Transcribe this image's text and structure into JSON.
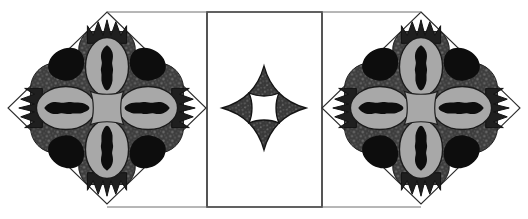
{
  "figure": {
    "canvas": {
      "width": 528,
      "height": 219,
      "background": "#ffffff"
    },
    "palette": {
      "background": "#ffffff",
      "outline": "#1a1a1a",
      "panel_stroke": "#2b2b2b",
      "dark_texture": "#3a3a3a",
      "dark_texture_speckle": "#6e6e6e",
      "mid_gray": "#9b9b9b",
      "light_gray": "#a8a8a8",
      "black_motif": "#0d0d0d",
      "motif_outline": "#141414",
      "shadow_line": "#8c8c8c"
    },
    "panels": [
      {
        "id": "panel-left",
        "shape": "diamond",
        "label": "Left diamond medallion",
        "center_x": 107,
        "center_y": 108,
        "half_width": 99,
        "half_height": 96,
        "contains": "quatrefoil-medallion"
      },
      {
        "id": "panel-center",
        "shape": "rectangle",
        "label": "Center rectangular panel",
        "x": 207,
        "y": 12,
        "width": 115,
        "height": 195,
        "contains": "four-point-star"
      },
      {
        "id": "panel-right",
        "shape": "diamond",
        "label": "Right diamond medallion",
        "center_x": 421,
        "center_y": 108,
        "half_width": 99,
        "half_height": 96,
        "contains": "quatrefoil-medallion"
      }
    ],
    "motifs": {
      "quatrefoil": {
        "name": "quatrefoil-medallion",
        "description": "Four-lobed rosette with speckled dark ground, four light gray oval lobes each holding a black beaded blob, crown-like spiked tips on each arm, black petal shapes in the diagonals, and a light gray concave-square core",
        "arm_count": 4,
        "arm_tip": "crown-spikes",
        "core": "concave-square",
        "core_fill": "#a8a8a8",
        "lobe_fill": "#a8a8a8",
        "blob_fill": "#0d0d0d",
        "ground_fill": "#4a4a4a",
        "corner_petal_fill": "#0d0d0d",
        "lobe_radius_x": 30,
        "lobe_radius_y": 20,
        "core_radius": 16
      },
      "star": {
        "name": "four-point-star",
        "description": "Dark speckled four-pointed concave star (astroid) with a white concave-square opening at its center",
        "point_count": 4,
        "fill": "#3a3a3a",
        "hole_fill": "#ffffff",
        "outer_radius": 42,
        "hole_radius": 16,
        "center_x": 264,
        "center_y": 108
      }
    },
    "guides": {
      "baseline_y": 207,
      "top_rule_y": 12,
      "left_rule_x": 207,
      "right_rule_x": 322
    }
  }
}
